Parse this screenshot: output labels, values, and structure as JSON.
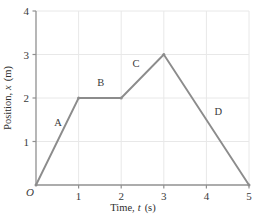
{
  "chart_data": {
    "type": "line",
    "title": "",
    "xlabel": "Time, t (s)",
    "xlabel_text": "Time,",
    "xlabel_var": "t",
    "xlabel_unit": "(s)",
    "ylabel": "Position, x (m)",
    "ylabel_text": "Position,",
    "ylabel_var": "x",
    "ylabel_unit": "(m)",
    "origin_label": "O",
    "xlim": [
      0,
      5
    ],
    "ylim": [
      0,
      4
    ],
    "xticks": [
      1,
      2,
      3,
      4,
      5
    ],
    "xtick_labels": [
      "1",
      "2",
      "3",
      "4",
      "5"
    ],
    "yticks": [
      1,
      2,
      3,
      4
    ],
    "ytick_labels": [
      "1",
      "2",
      "3",
      "4"
    ],
    "grid": true,
    "legend": "none",
    "line_color": "#8c8c8c",
    "grid_color": "#e8e8e8",
    "axis_color": "#909090",
    "x": [
      0,
      1,
      2,
      3,
      5
    ],
    "y": [
      0,
      2,
      2,
      3,
      0
    ],
    "points": [
      {
        "x": 0,
        "y": 0
      },
      {
        "x": 1,
        "y": 2
      },
      {
        "x": 2,
        "y": 2
      },
      {
        "x": 3,
        "y": 3
      },
      {
        "x": 5,
        "y": 0
      }
    ],
    "annotations": [
      {
        "label": "A",
        "x": 0.52,
        "y": 1.35
      },
      {
        "label": "B",
        "x": 1.52,
        "y": 2.28
      },
      {
        "label": "C",
        "x": 2.35,
        "y": 2.72
      },
      {
        "label": "D",
        "x": 4.28,
        "y": 1.6
      }
    ]
  }
}
